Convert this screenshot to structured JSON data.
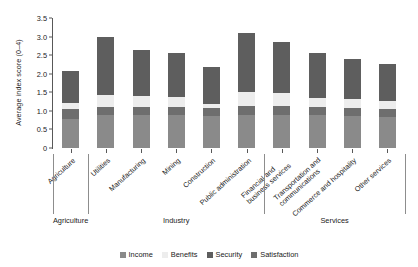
{
  "chart_data": {
    "type": "bar",
    "title": "",
    "xlabel": "",
    "ylabel": "Average index score (0–4)",
    "ylim": [
      0,
      3.5
    ],
    "yticks": [
      "0",
      "0.5",
      "1.0",
      "1.5",
      "2.0",
      "2.5",
      "3.0",
      "3.5"
    ],
    "ytick_values": [
      0,
      0.5,
      1.0,
      1.5,
      2.0,
      2.5,
      3.0,
      3.5
    ],
    "stacked": true,
    "grid": false,
    "legend_position": "bottom",
    "series": [
      {
        "name": "Income",
        "color": "#8a8a8a",
        "values": [
          0.78,
          0.88,
          0.88,
          0.88,
          0.85,
          0.88,
          0.9,
          0.88,
          0.85,
          0.83
        ]
      },
      {
        "name": "Satisfaction",
        "color": "#6e6e6e",
        "values": [
          0.27,
          0.22,
          0.22,
          0.22,
          0.22,
          0.25,
          0.22,
          0.22,
          0.22,
          0.22
        ]
      },
      {
        "name": "Benefits",
        "color": "#ededed",
        "values": [
          0.15,
          0.32,
          0.3,
          0.28,
          0.12,
          0.38,
          0.35,
          0.25,
          0.25,
          0.22
        ]
      },
      {
        "name": "Security",
        "color": "#5e5e5e",
        "values": [
          0.88,
          1.58,
          1.25,
          1.17,
          0.98,
          1.59,
          1.38,
          1.2,
          1.08,
          1.0
        ]
      }
    ],
    "categories": [
      "Agriculture",
      "Utilities",
      "Manufacturing",
      "Mining",
      "Construction",
      "Public administration",
      "Financial and business services",
      "Transportation and communications",
      "Commerce and hospitality",
      "Other services"
    ],
    "category_lines": [
      [
        "Agriculture"
      ],
      [
        "Utilities"
      ],
      [
        "Manufacturing"
      ],
      [
        "Mining"
      ],
      [
        "Construction"
      ],
      [
        "Public administration"
      ],
      [
        "Financial and",
        "business services"
      ],
      [
        "Transportation and",
        "communications"
      ],
      [
        "Commerce and hospitality"
      ],
      [
        "Other services"
      ]
    ],
    "totals": [
      2.08,
      3.0,
      2.65,
      2.55,
      2.17,
      3.1,
      2.85,
      2.55,
      2.4,
      2.27
    ],
    "groups": [
      {
        "label": "Agriculture",
        "members": [
          "Agriculture"
        ]
      },
      {
        "label": "Industry",
        "members": [
          "Utilities",
          "Manufacturing",
          "Mining",
          "Construction",
          "Public administration"
        ]
      },
      {
        "label": "Services",
        "members": [
          "Financial and business services",
          "Transportation and communications",
          "Commerce and hospitality",
          "Other services"
        ]
      }
    ],
    "legend": [
      {
        "label": "Income",
        "color": "#8a8a8a"
      },
      {
        "label": "Benefits",
        "color": "#ededed"
      },
      {
        "label": "Security",
        "color": "#5e5e5e"
      },
      {
        "label": "Satisfaction",
        "color": "#6e6e6e"
      }
    ]
  }
}
